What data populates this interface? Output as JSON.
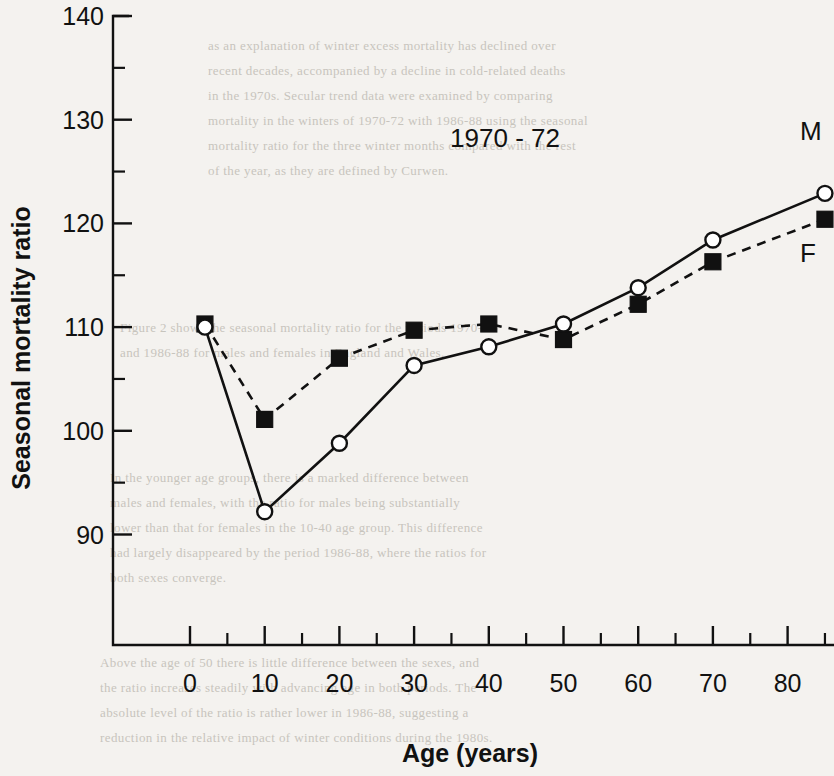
{
  "chart_data": {
    "type": "line",
    "title": "1970 - 72",
    "xlabel": "Age (years)",
    "ylabel": "Seasonal mortality ratio",
    "xlim": [
      -5,
      88
    ],
    "ylim": [
      86,
      140
    ],
    "grid": false,
    "legend_position": "inline-right",
    "x_ticks": [
      0,
      10,
      20,
      30,
      40,
      50,
      60,
      70,
      80
    ],
    "x_tick_labels": [
      "0",
      "10",
      "20",
      "30",
      "40",
      "50",
      "60",
      "70",
      "80"
    ],
    "x_minor_ticks": [
      5,
      15,
      25,
      35,
      45,
      55,
      65,
      75,
      85
    ],
    "y_ticks": [
      90,
      100,
      110,
      120,
      130,
      140
    ],
    "y_tick_labels": [
      "90",
      "100",
      "110",
      "120",
      "130",
      "140"
    ],
    "y_minor_ticks": [
      95,
      105,
      115,
      125,
      135
    ],
    "series": [
      {
        "name": "M",
        "label": "M",
        "marker": "open-circle",
        "linestyle": "solid",
        "x": [
          2,
          10,
          20,
          30,
          40,
          50,
          60,
          70,
          85
        ],
        "values": [
          110.0,
          92.2,
          98.8,
          106.3,
          108.1,
          110.3,
          113.8,
          118.4,
          122.9
        ]
      },
      {
        "name": "F",
        "label": "F",
        "marker": "filled-square",
        "linestyle": "dashed",
        "x": [
          2,
          10,
          20,
          30,
          40,
          50,
          60,
          70,
          85
        ],
        "values": [
          110.3,
          101.1,
          107.0,
          109.7,
          110.3,
          108.8,
          112.2,
          116.3,
          120.4
        ]
      }
    ]
  },
  "figure": {
    "title": "1970 - 72",
    "x_axis_title": "Age (years)",
    "y_axis_title": "Seasonal mortality ratio",
    "series_label_m": "M",
    "series_label_f": "F",
    "colors": {
      "ink": "#111111",
      "page": "#f4f2ef",
      "ghost_text": "#b9b5ad"
    }
  },
  "page_background_text": {
    "lines": [
      "as an explanation of winter excess mortality has declined over",
      "recent decades, accompanied by a decline in cold-related deaths",
      "in the 1970s. Secular trend data were examined by comparing",
      "mortality in the winters of 1970-72 with 1986-88 using the seasonal",
      "mortality ratio for the three winter months compared with the rest",
      "of the year, as they are defined by Curwen.",
      "",
      "Figure 2 shows the seasonal mortality ratio for the periods 1970-72",
      "and 1986-88 for males and females in England and Wales.",
      "",
      "In the younger age groups, there is a marked difference between",
      "males and females, with the ratio for males being substantially",
      "lower than that for females in the 10-40 age group. This difference",
      "had largely disappeared by the period 1986-88, where the ratios for",
      "both sexes converge.",
      "",
      "Above the age of 50 there is little difference between the sexes, and",
      "the ratio increases steadily with advancing age in both periods. The",
      "absolute level of the ratio is rather lower in 1986-88, suggesting a",
      "reduction in the relative impact of winter conditions during the 1980s."
    ]
  }
}
